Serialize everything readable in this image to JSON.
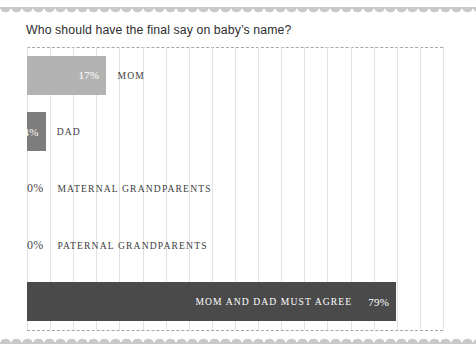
{
  "chart_title": "Who should have the final say on baby’s name?",
  "decoration": {
    "top_scallop": "scalloped-edge",
    "bottom_scallop": "scalloped-edge",
    "scallop_color": "#c9c9c9"
  },
  "axis": {
    "top_rule": "dashed",
    "bottom_rule": "dashed",
    "rule_color": "#a6a6a6",
    "gridline_color": "#e2e2e2",
    "gridline_count": 19
  },
  "chart_data": {
    "type": "bar",
    "orientation": "horizontal",
    "title": "Who should have the final say on baby’s name?",
    "xlabel": "",
    "ylabel": "",
    "xlim": [
      0,
      89
    ],
    "grid": true,
    "legend": "none",
    "categories": [
      "MOM",
      "DAD",
      "MATERNAL GRANDPARENTS",
      "PATERNAL GRANDPARENTS",
      "MOM AND DAD MUST AGREE"
    ],
    "values": [
      17,
      4,
      0,
      0,
      79
    ],
    "value_labels": [
      "17%",
      "4%",
      "0%",
      "4%",
      "79%"
    ],
    "bars": [
      {
        "category": "MOM",
        "value": 17,
        "value_label": "17%",
        "color": "#b3b3b3",
        "value_label_position": "inside-right",
        "value_label_color": "#ffffff",
        "category_label_position": "outside-right"
      },
      {
        "category": "DAD",
        "value": 4,
        "value_label": "4%",
        "color": "#7d7d7d",
        "value_label_position": "inside-right",
        "value_label_color": "#ffffff",
        "category_label_position": "outside-right"
      },
      {
        "category": "MATERNAL GRANDPARENTS",
        "value": 0,
        "value_label": "0%",
        "color": "none",
        "value_label_position": "outside-left",
        "value_label_color": "#4a4a4a",
        "category_label_position": "outside-right"
      },
      {
        "category": "PATERNAL GRANDPARENTS",
        "value": 0,
        "value_label": "0%",
        "color": "none",
        "value_label_position": "outside-left",
        "value_label_color": "#4a4a4a",
        "category_label_position": "outside-right"
      },
      {
        "category": "MOM AND DAD MUST AGREE",
        "value": 79,
        "value_label": "79%",
        "color": "#4a4a4a",
        "value_label_position": "inside-right",
        "value_label_color": "#ffffff",
        "category_label_position": "inside-right"
      }
    ]
  }
}
